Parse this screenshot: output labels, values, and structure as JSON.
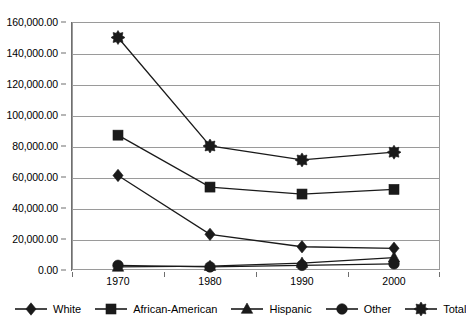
{
  "chart_data": {
    "type": "line",
    "title": "",
    "subtitle": "",
    "xlabel": "",
    "ylabel": "",
    "categories": [
      "1970",
      "1980",
      "1990",
      "2000"
    ],
    "x": [
      1970,
      1980,
      1990,
      2000
    ],
    "ylim": [
      0,
      160000
    ],
    "ytick_values": [
      0,
      20000,
      40000,
      60000,
      80000,
      100000,
      120000,
      140000,
      160000
    ],
    "ytick_labels": [
      "0.00",
      "20,000.00",
      "40,000.00",
      "60,000.00",
      "80,000.00",
      "100,000.00",
      "120,000.00",
      "140,000.00",
      "160,000.00"
    ],
    "grid": true,
    "grid_axis": "y",
    "legend_position": "bottom",
    "series": [
      {
        "name": "White",
        "marker": "diamond",
        "color": "#1a1a1a",
        "values": [
          61000,
          23000,
          15000,
          14000
        ]
      },
      {
        "name": "African-American",
        "marker": "square",
        "color": "#1a1a1a",
        "values": [
          87000,
          53500,
          49000,
          52000
        ]
      },
      {
        "name": "Hispanic",
        "marker": "triangle",
        "color": "#1a1a1a",
        "values": [
          2000,
          2500,
          4500,
          8000
        ]
      },
      {
        "name": "Other",
        "marker": "circle",
        "color": "#1a1a1a",
        "values": [
          3000,
          2000,
          3000,
          4000
        ]
      },
      {
        "name": "Total",
        "marker": "starburst",
        "color": "#1a1a1a",
        "values": [
          150000,
          80000,
          71000,
          76000
        ]
      }
    ]
  },
  "legend": {
    "items": [
      {
        "label": "White",
        "marker": "diamond"
      },
      {
        "label": "African-American",
        "marker": "square"
      },
      {
        "label": "Hispanic",
        "marker": "triangle"
      },
      {
        "label": "Other",
        "marker": "circle"
      },
      {
        "label": "Total",
        "marker": "starburst"
      }
    ]
  },
  "colors": {
    "series": "#1a1a1a",
    "grid": "#9a9a9a",
    "axis": "#6f6f6f",
    "background": "#ffffff",
    "text": "#000000"
  }
}
